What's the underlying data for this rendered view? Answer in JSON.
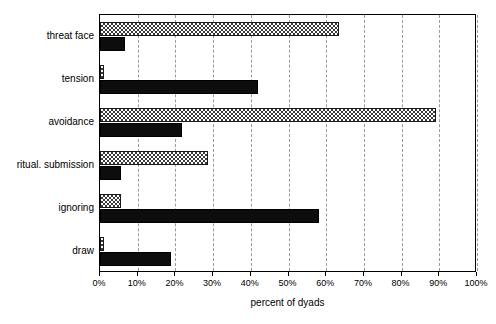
{
  "chart_data": {
    "type": "bar",
    "orientation": "horizontal",
    "title": "",
    "xlabel": "percent of dyads",
    "ylabel": "",
    "xlim": [
      0,
      100
    ],
    "xticks": [
      0,
      10,
      20,
      30,
      40,
      50,
      60,
      70,
      80,
      90,
      100
    ],
    "xticklabels": [
      "0%",
      "10%",
      "20%",
      "30%",
      "40%",
      "50%",
      "60%",
      "70%",
      "80%",
      "90%",
      "100%"
    ],
    "grid": "vertical-dashed",
    "legend": "none",
    "categories": [
      "threat face",
      "tension",
      "avoidance",
      "ritual. submission",
      "ignoring",
      "draw"
    ],
    "series": [
      {
        "name": "hatched",
        "style": "checkerboard-hatch",
        "color": "#3a3a3a",
        "values": [
          63.4,
          1.0,
          89.0,
          28.6,
          5.5,
          1.0
        ]
      },
      {
        "name": "solid",
        "style": "solid-black",
        "color": "#0d0d0d",
        "values": [
          6.5,
          42.0,
          21.7,
          5.5,
          58.0,
          18.8
        ]
      }
    ]
  },
  "axis": {
    "x_title": "percent of dyads"
  }
}
